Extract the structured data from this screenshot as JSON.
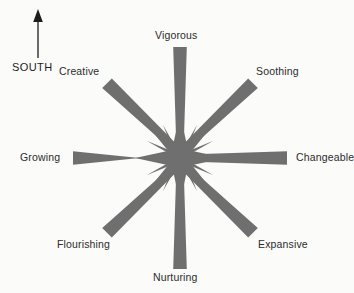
{
  "diagram": {
    "type": "compass-rose",
    "background_color": "#fbfbfa",
    "ray_color": "#6f6f6f",
    "text_color": "#2b2b2b",
    "center": {
      "x": 180,
      "y": 158
    },
    "compass": {
      "direction_label": "SOUTH",
      "arrow_direction": "up",
      "arrow_color": "#1d1d1d",
      "arrow_tip": {
        "x": 38,
        "y": 12
      },
      "arrow_tail": {
        "x": 38,
        "y": 58
      }
    },
    "points": [
      {
        "label": "Vigorous",
        "angle_deg": 90,
        "direction": "north",
        "ray_length": 112
      },
      {
        "label": "Soothing",
        "angle_deg": 45,
        "direction": "northeast",
        "ray_length": 108
      },
      {
        "label": "Changeable",
        "angle_deg": 0,
        "direction": "east",
        "ray_length": 107
      },
      {
        "label": "Expansive",
        "angle_deg": 315,
        "direction": "southeast",
        "ray_length": 108
      },
      {
        "label": "Nurturing",
        "angle_deg": 270,
        "direction": "south",
        "ray_length": 112
      },
      {
        "label": "Flourishing",
        "angle_deg": 225,
        "direction": "southwest",
        "ray_length": 108
      },
      {
        "label": "Growing",
        "angle_deg": 180,
        "direction": "west",
        "ray_length": 107
      },
      {
        "label": "Creative",
        "angle_deg": 135,
        "direction": "northwest",
        "ray_length": 108
      }
    ]
  }
}
